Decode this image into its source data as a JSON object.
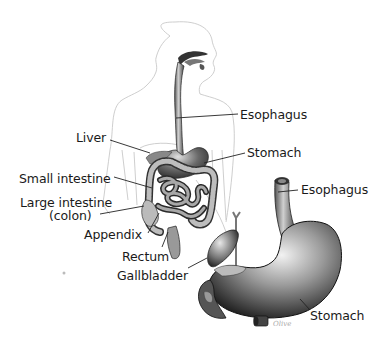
{
  "diagram": {
    "type": "anatomical-illustration",
    "labels": {
      "esophagus_body": "Esophagus",
      "liver": "Liver",
      "stomach_body": "Stomach",
      "small_intestine": "Small intestine",
      "large_intestine_line1": "Large intestine",
      "large_intestine_line2": "(colon)",
      "appendix": "Appendix",
      "rectum": "Rectum",
      "gallbladder": "Gallbladder",
      "esophagus_detail": "Esophagus",
      "stomach_detail": "Stomach"
    },
    "colors": {
      "background": "#ffffff",
      "outline": "#c8c8c8",
      "organ_dark": "#2a2a2a",
      "organ_mid": "#7a7a7a",
      "organ_light": "#d8d8d8",
      "leader_line": "#222222",
      "text": "#1a1a1a"
    }
  }
}
